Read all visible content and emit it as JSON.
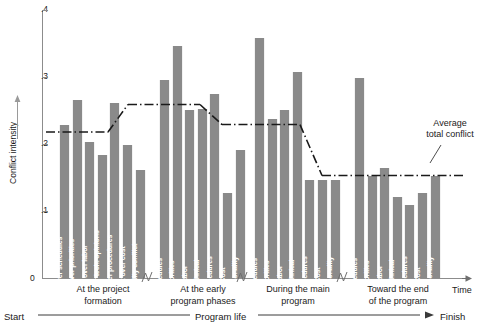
{
  "chart_data": {
    "type": "bar",
    "title": "",
    "xlabel": "Time",
    "ylabel": "Conflict intensity",
    "ylim": [
      0,
      0.4
    ],
    "y_ticks": [
      ".1",
      ".2",
      ".3",
      ".4"
    ],
    "y_tick_values": [
      0.1,
      0.2,
      0.3,
      0.4
    ],
    "grid": false,
    "legend": "none",
    "zero_label": "0",
    "groups": [
      {
        "caption": "At the project\nformation",
        "caption_line1": "At the project",
        "caption_line2": "formation",
        "average": 0.218,
        "bars": [
          {
            "label": "Conflict over schedules",
            "value": 0.228
          },
          {
            "label": "Conflict over priorities",
            "value": 0.265
          },
          {
            "label": "Conflict over labor",
            "value": 0.203
          },
          {
            "label": "Conflict over tech. opinions",
            "value": 0.183
          },
          {
            "label": "Conflict over procedures",
            "value": 0.261
          },
          {
            "label": "Conflict over cost",
            "value": 0.198
          },
          {
            "label": "Personality conflict",
            "value": 0.161
          }
        ]
      },
      {
        "caption": "At the early\nprogram phases",
        "caption_line1": "At the early",
        "caption_line2": "program phases",
        "average": 0.259,
        "bars": [
          {
            "label": "Schedules",
            "value": 0.295
          },
          {
            "label": "Priorities",
            "value": 0.347
          },
          {
            "label": "Labor",
            "value": 0.251
          },
          {
            "label": "Technical",
            "value": 0.253
          },
          {
            "label": "Procedures",
            "value": 0.274
          },
          {
            "label": "Cost",
            "value": 0.127
          },
          {
            "label": "Personality",
            "value": 0.191
          }
        ]
      },
      {
        "caption": "During the main\nprogram",
        "caption_line1": "During the main",
        "caption_line2": "program",
        "average": 0.229,
        "bars": [
          {
            "label": "Schedules",
            "value": 0.358
          },
          {
            "label": "Priorities",
            "value": 0.237
          },
          {
            "label": "Labor",
            "value": 0.251
          },
          {
            "label": "Technical",
            "value": 0.308
          },
          {
            "label": "Procedures",
            "value": 0.146
          },
          {
            "label": "Cost",
            "value": 0.146
          },
          {
            "label": "Personality",
            "value": 0.146
          }
        ]
      },
      {
        "caption": "Toward the end\nof the program",
        "caption_line1": "Toward the end",
        "caption_line2": "of the program",
        "average": 0.153,
        "bars": [
          {
            "label": "Schedules",
            "value": 0.298
          },
          {
            "label": "Priorities",
            "value": 0.153
          },
          {
            "label": "Labor",
            "value": 0.164
          },
          {
            "label": "Technical",
            "value": 0.121
          },
          {
            "label": "Procedures",
            "value": 0.109
          },
          {
            "label": "Cost",
            "value": 0.127
          },
          {
            "label": "Personality",
            "value": 0.153
          }
        ]
      }
    ],
    "annotations": [
      {
        "name": "average-total-conflict",
        "text_line1": "Average",
        "text_line2": "total conflict"
      }
    ],
    "timeline": {
      "start": "Start",
      "middle": "Program life",
      "finish": "Finish"
    },
    "colors": {
      "bar": "#8a8a8a",
      "axis": "#8c8c8c",
      "average_line": "#1a1a1a",
      "text": "#1a1a1a"
    }
  }
}
